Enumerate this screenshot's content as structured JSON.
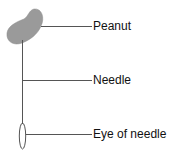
{
  "diagram": {
    "labels": [
      {
        "text": "Peanut",
        "y": 19
      },
      {
        "text": "Needle",
        "y": 73
      },
      {
        "text": "Eye of needle",
        "y": 127
      }
    ],
    "colors": {
      "peanut": "#9a9a9a",
      "line": "#555555",
      "text": "#111111"
    }
  }
}
